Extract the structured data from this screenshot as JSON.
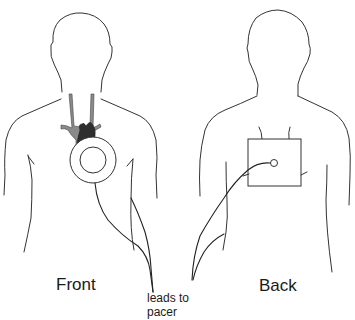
{
  "diagram": {
    "labels": {
      "front": "Front",
      "back": "Back",
      "leads_line1": "leads to",
      "leads_line2": "pacer"
    },
    "colors": {
      "outline": "#333333",
      "vessel_fill": "#8a8a8a",
      "heart_fill": "#2e2e2e",
      "background": "#ffffff"
    },
    "views": [
      {
        "name": "front",
        "components": [
          "body-outline",
          "great-vessels",
          "heart",
          "pacer-device-circle",
          "leads"
        ]
      },
      {
        "name": "back",
        "components": [
          "body-outline",
          "pacer-patch-square",
          "lead-connector-circle",
          "leads"
        ]
      }
    ]
  }
}
